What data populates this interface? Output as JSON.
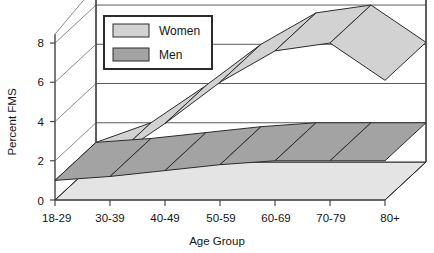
{
  "chart_data": {
    "type": "area",
    "title": "",
    "xlabel": "Age Group",
    "ylabel": "Percent FMS",
    "categories": [
      "18-29",
      "30-39",
      "40-49",
      "50-59",
      "60-69",
      "70-79",
      "80+"
    ],
    "series": [
      {
        "name": "Women",
        "values": [
          1.0,
          2.0,
          3.9,
          6.0,
          7.6,
          8.0,
          6.1
        ],
        "color": "#d2d2d2"
      },
      {
        "name": "Men",
        "values": [
          1.0,
          1.2,
          1.5,
          1.8,
          2.0,
          2.0,
          2.0
        ],
        "color": "#a3a3a3"
      }
    ],
    "ylim": [
      0,
      9
    ],
    "yticks": [
      0,
      2,
      4,
      6,
      8
    ],
    "ytick_labels": [
      "0",
      "2",
      "4",
      "6",
      "8"
    ],
    "grid": true,
    "legend_position": "top-left",
    "projection": "3d-ribbon",
    "floor_color": "#e4e4e4",
    "outline_color": "#2b2b2b"
  },
  "legend": {
    "entries": [
      {
        "label": "Women",
        "swatch": "#d2d2d2"
      },
      {
        "label": "Men",
        "swatch": "#a3a3a3"
      }
    ]
  },
  "axes": {
    "y_title": "Percent FMS",
    "x_title": "Age Group",
    "y_ticks": [
      "8",
      "6",
      "4",
      "2",
      "0"
    ],
    "x_ticks": [
      "18-29",
      "30-39",
      "40-49",
      "50-59",
      "60-69",
      "70-79",
      "80+"
    ]
  }
}
